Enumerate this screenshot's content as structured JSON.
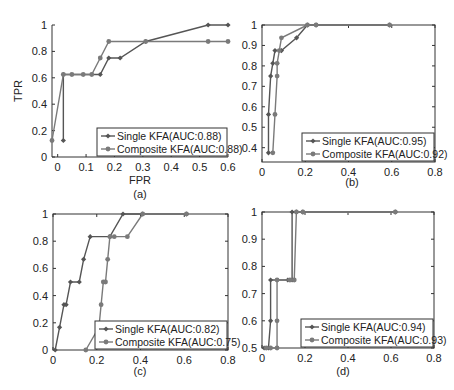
{
  "chart_data": [
    {
      "id": "a",
      "type": "line",
      "caption": "(a)",
      "xlabel": "FPR",
      "ylabel": "TPR",
      "xlim": [
        -0.02,
        0.6
      ],
      "ylim": [
        0,
        1
      ],
      "xticks": [
        "0",
        "0.1",
        "0.2",
        "0.3",
        "0.4",
        "0.5",
        "0.6"
      ],
      "xtick_values": [
        0,
        0.1,
        0.2,
        0.3,
        0.4,
        0.5,
        0.6
      ],
      "yticks": [
        "0",
        "0.2",
        "0.4",
        "0.6",
        "0.8",
        "1"
      ],
      "ytick_values": [
        0,
        0.2,
        0.4,
        0.6,
        0.8,
        1
      ],
      "box": false,
      "series": [
        {
          "name": "Single KFA(AUC:0.88)",
          "marker": "diamond",
          "x": [
            0.02,
            0.02,
            0.15,
            0.18,
            0.22,
            0.31,
            0.53,
            0.6
          ],
          "y": [
            0.125,
            0.625,
            0.625,
            0.75,
            0.75,
            0.875,
            1.0,
            1.0
          ]
        },
        {
          "name": "Composite KFA(AUC:0.88)",
          "marker": "circle",
          "x": [
            -0.02,
            0.02,
            0.05,
            0.09,
            0.12,
            0.15,
            0.18,
            0.31,
            0.53,
            0.6
          ],
          "y": [
            0.125,
            0.625,
            0.625,
            0.625,
            0.625,
            0.75,
            0.875,
            0.875,
            0.875,
            0.875
          ]
        }
      ]
    },
    {
      "id": "b",
      "type": "line",
      "caption": "(b)",
      "xlabel": "",
      "ylabel": "",
      "xlim": [
        0,
        0.8
      ],
      "ylim": [
        0.33,
        1
      ],
      "xticks": [
        "0",
        "0.2",
        "0.4",
        "0.6",
        "0.8"
      ],
      "xtick_values": [
        0,
        0.2,
        0.4,
        0.6,
        0.8
      ],
      "yticks": [
        "0.4",
        "0.5",
        "0.6",
        "0.7",
        "0.8",
        "0.9",
        "1"
      ],
      "ytick_values": [
        0.4,
        0.5,
        0.6,
        0.7,
        0.8,
        0.9,
        1
      ],
      "box": true,
      "series": [
        {
          "name": "Single KFA(AUC:0.95)",
          "marker": "diamond",
          "x": [
            0.03,
            0.03,
            0.04,
            0.05,
            0.06,
            0.09,
            0.16,
            0.21,
            0.25,
            0.59
          ],
          "y": [
            0.375,
            0.5625,
            0.75,
            0.8125,
            0.875,
            0.875,
            0.9375,
            1.0,
            1.0,
            1.0
          ]
        },
        {
          "name": "Composite KFA(AUC:0.92)",
          "marker": "circle",
          "x": [
            0.05,
            0.06,
            0.07,
            0.07,
            0.08,
            0.09,
            0.21,
            0.25,
            0.59
          ],
          "y": [
            0.375,
            0.5625,
            0.75,
            0.8125,
            0.875,
            0.9375,
            1.0,
            1.0,
            1.0
          ]
        }
      ]
    },
    {
      "id": "c",
      "type": "line",
      "caption": "(c)",
      "xlabel": "",
      "ylabel": "",
      "xlim": [
        0,
        0.8
      ],
      "ylim": [
        0,
        1
      ],
      "xticks": [
        "0",
        "0.2",
        "0.4",
        "0.6",
        "0.8"
      ],
      "xtick_values": [
        0,
        0.2,
        0.4,
        0.6,
        0.8
      ],
      "yticks": [
        "0",
        "0.2",
        "0.4",
        "0.6",
        "0.8",
        "1"
      ],
      "ytick_values": [
        0,
        0.2,
        0.4,
        0.6,
        0.8,
        1
      ],
      "box": true,
      "series": [
        {
          "name": "Single KFA(AUC:0.82)",
          "marker": "diamond",
          "x": [
            0.01,
            0.03,
            0.05,
            0.06,
            0.08,
            0.12,
            0.14,
            0.17,
            0.26,
            0.32,
            0.41,
            0.61
          ],
          "y": [
            0,
            0.1667,
            0.3333,
            0.3333,
            0.5,
            0.5,
            0.6667,
            0.8333,
            0.8333,
            1.0,
            1.0,
            1.0
          ]
        },
        {
          "name": "Composite KFA(AUC:0.75)",
          "marker": "circle",
          "x": [
            0.15,
            0.21,
            0.22,
            0.23,
            0.24,
            0.25,
            0.26,
            0.28,
            0.34,
            0.41,
            0.61
          ],
          "y": [
            0,
            0.1667,
            0.3333,
            0.5,
            0.5,
            0.6667,
            0.8333,
            0.8333,
            0.8333,
            1.0,
            1.0
          ]
        }
      ]
    },
    {
      "id": "d",
      "type": "line",
      "caption": "(d)",
      "xlabel": "",
      "ylabel": "",
      "xlim": [
        0,
        0.8
      ],
      "ylim": [
        0.5,
        1
      ],
      "xticks": [
        "0",
        "0.2",
        "0.4",
        "0.6",
        "0.8"
      ],
      "xtick_values": [
        0,
        0.2,
        0.4,
        0.6,
        0.8
      ],
      "yticks": [
        "0.5",
        "0.6",
        "0.7",
        "0.8",
        "0.9",
        "1"
      ],
      "ytick_values": [
        0.5,
        0.6,
        0.7,
        0.8,
        0.9,
        1
      ],
      "box": true,
      "series": [
        {
          "name": "Single KFA(AUC:0.94)",
          "marker": "diamond",
          "x": [
            0.01,
            0.03,
            0.04,
            0.04,
            0.12,
            0.14,
            0.14,
            0.16,
            0.19,
            0.62
          ],
          "y": [
            0.5,
            0.5,
            0.6,
            0.75,
            0.75,
            0.75,
            1.0,
            1.0,
            1.0,
            1.0
          ]
        },
        {
          "name": "Composite KFA(AUC:0.93)",
          "marker": "circle",
          "x": [
            0.02,
            0.04,
            0.07,
            0.07,
            0.07,
            0.13,
            0.15,
            0.16,
            0.19,
            0.62
          ],
          "y": [
            0.5,
            0.5,
            0.5,
            0.6,
            0.75,
            0.75,
            0.75,
            1.0,
            1.0,
            1.0
          ]
        }
      ]
    }
  ],
  "panels": {
    "a": {
      "caption": "(a)",
      "xlabel": "FPR",
      "ylabel": "TPR",
      "legend": [
        "Single KFA(AUC:0.88)",
        "Composite KFA(AUC:0.88)"
      ]
    },
    "b": {
      "caption": "(b)",
      "legend": [
        "Single KFA(AUC:0.95)",
        "Composite KFA(AUC:0.92)"
      ]
    },
    "c": {
      "caption": "(c)",
      "legend": [
        "Single KFA(AUC:0.82)",
        "Composite KFA(AUC:0.75)"
      ]
    },
    "d": {
      "caption": "(d)",
      "legend": [
        "Single KFA(AUC:0.94)",
        "Composite KFA(AUC:0.93)"
      ]
    }
  },
  "colors": {
    "single": "#555555",
    "composite": "#7a7a7a",
    "axis": "#333333"
  }
}
